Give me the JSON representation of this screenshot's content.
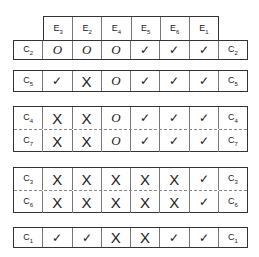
{
  "header": {
    "columns": [
      {
        "base": "E",
        "sub": "3"
      },
      {
        "base": "E",
        "sub": "2"
      },
      {
        "base": "E",
        "sub": "4"
      },
      {
        "base": "E",
        "sub": "5"
      },
      {
        "base": "E",
        "sub": "6"
      },
      {
        "base": "E",
        "sub": "1"
      }
    ]
  },
  "legend": {
    "check": "✓",
    "cross": "╳",
    "circle": "O"
  },
  "groups": [
    {
      "top": 40,
      "height": 20,
      "rows": [
        {
          "label": {
            "base": "C",
            "sub": "2"
          },
          "cells": [
            "O",
            "O",
            "O",
            "✓",
            "✓",
            "✓"
          ]
        }
      ]
    },
    {
      "top": 70,
      "height": 22,
      "rows": [
        {
          "label": {
            "base": "C",
            "sub": "5"
          },
          "cells": [
            "✓",
            "X",
            "O",
            "✓",
            "✓",
            "✓"
          ]
        }
      ]
    },
    {
      "top": 106,
      "height": 46,
      "rows": [
        {
          "label": {
            "base": "C",
            "sub": "4"
          },
          "cells": [
            "X",
            "X",
            "O",
            "✓",
            "✓",
            "✓"
          ]
        },
        {
          "label": {
            "base": "C",
            "sub": "7"
          },
          "cells": [
            "X",
            "X",
            "O",
            "✓",
            "✓",
            "✓"
          ]
        }
      ]
    },
    {
      "top": 167,
      "height": 46,
      "rows": [
        {
          "label": {
            "base": "C",
            "sub": "3"
          },
          "cells": [
            "X",
            "X",
            "X",
            "X",
            "X",
            "✓"
          ]
        },
        {
          "label": {
            "base": "C",
            "sub": "6"
          },
          "cells": [
            "X",
            "X",
            "X",
            "X",
            "X",
            "✓"
          ]
        }
      ]
    },
    {
      "top": 227,
      "height": 21,
      "rows": [
        {
          "label": {
            "base": "C",
            "sub": "1"
          },
          "cells": [
            "✓",
            "✓",
            "X",
            "X",
            "✓",
            "✓"
          ]
        }
      ]
    }
  ]
}
